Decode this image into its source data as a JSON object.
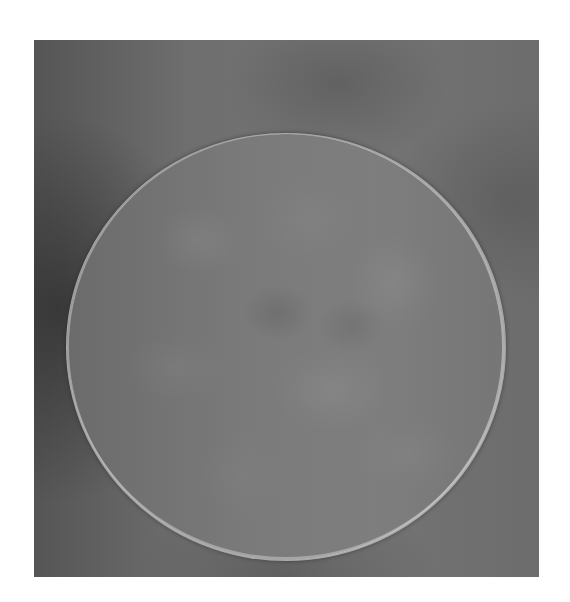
{
  "image": {
    "subject": "circular polished disc showing grain structure",
    "background_color": "#ffffff",
    "photo_tone": "grayscale",
    "colors": {
      "backdrop_dark": "#555555",
      "backdrop_mid": "#6e6e6e",
      "disc_base": "#7a7a7a",
      "disc_rim": "#c8c8c8"
    }
  }
}
